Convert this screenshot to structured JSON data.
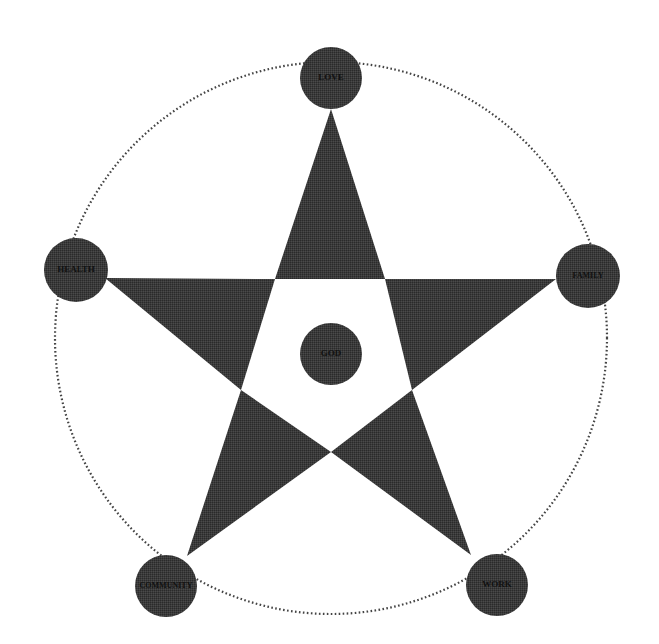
{
  "diagram": {
    "type": "pentagram-concept-diagram",
    "colors": {
      "background": "#ffffff",
      "star_fill": "#3a3a3a",
      "node_fill": "#3c3c3c",
      "outline_dots": "#444444",
      "label_text": "#111111"
    },
    "outer_circle": {
      "cx": 331,
      "cy": 338,
      "r": 276,
      "style": "dotted"
    },
    "star": {
      "outer_points": [
        [
          331,
          109
        ],
        [
          556,
          279
        ],
        [
          471,
          555
        ],
        [
          187,
          556
        ],
        [
          105,
          278
        ]
      ],
      "inner_pentagon": [
        [
          275,
          279
        ],
        [
          385,
          279
        ],
        [
          412,
          390
        ],
        [
          331,
          452
        ],
        [
          241,
          390
        ]
      ]
    },
    "center": {
      "label": "GOD",
      "cx": 331,
      "cy": 354,
      "r": 31
    },
    "nodes": [
      {
        "id": "love",
        "label": "LOVE",
        "cx": 331,
        "cy": 78,
        "r": 31,
        "font_size": 9
      },
      {
        "id": "family",
        "label": "FAMILY",
        "cx": 588,
        "cy": 276,
        "r": 32,
        "font_size": 8
      },
      {
        "id": "work",
        "label": "WORK",
        "cx": 497,
        "cy": 585,
        "r": 31,
        "font_size": 9
      },
      {
        "id": "community",
        "label": "COMMUNITY",
        "cx": 166,
        "cy": 586,
        "r": 31,
        "font_size": 8
      },
      {
        "id": "health",
        "label": "HEALTH",
        "cx": 76,
        "cy": 270,
        "r": 32,
        "font_size": 9
      }
    ]
  }
}
